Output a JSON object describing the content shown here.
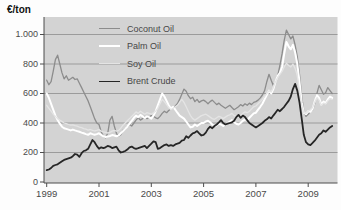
{
  "chart_data": {
    "type": "line",
    "title": "",
    "ylabel": "€/ton",
    "xlabel": "",
    "grid": true,
    "plot_bg": "#d3d3d3",
    "grid_color": "#9b9b9b",
    "axis_color": "#4d4d4d",
    "ylim": [
      0,
      1100
    ],
    "x_start_year": 1999,
    "x_months_per_point": 1,
    "legend_position": "top-left-overlay",
    "yticks": [
      {
        "value": 0,
        "label": "0"
      },
      {
        "value": 200,
        "label": "200"
      },
      {
        "value": 400,
        "label": "400"
      },
      {
        "value": 600,
        "label": "600"
      },
      {
        "value": 800,
        "label": "800"
      },
      {
        "value": 1000,
        "label": "1.000"
      }
    ],
    "xticks": [
      {
        "year": 1999,
        "label": "1999"
      },
      {
        "year": 2001,
        "label": "2001"
      },
      {
        "year": 2003,
        "label": "2003"
      },
      {
        "year": 2005,
        "label": "2005"
      },
      {
        "year": 2007,
        "label": "2007"
      },
      {
        "year": 2009,
        "label": "2009"
      }
    ],
    "series": [
      {
        "name": "Coconut Oil",
        "color": "#8c8c8c",
        "width": 1.3,
        "values": [
          690,
          660,
          680,
          750,
          830,
          860,
          800,
          740,
          700,
          720,
          690,
          700,
          710,
          695,
          700,
          670,
          640,
          610,
          580,
          550,
          510,
          470,
          430,
          400,
          390,
          340,
          310,
          300,
          330,
          420,
          445,
          380,
          330,
          310,
          320,
          350,
          360,
          375,
          390,
          380,
          400,
          420,
          435,
          420,
          430,
          445,
          430,
          440,
          450,
          445,
          435,
          430,
          445,
          465,
          480,
          470,
          485,
          495,
          505,
          515,
          530,
          560,
          595,
          630,
          615,
          585,
          565,
          575,
          545,
          560,
          540,
          550,
          555,
          545,
          530,
          545,
          555,
          540,
          525,
          535,
          520,
          510,
          500,
          510,
          520,
          505,
          490,
          500,
          510,
          525,
          515,
          530,
          520,
          535,
          525,
          540,
          545,
          555,
          570,
          590,
          620,
          680,
          730,
          690,
          655,
          680,
          720,
          790,
          870,
          960,
          1030,
          1000,
          970,
          990,
          930,
          850,
          730,
          580,
          480,
          445,
          460,
          475,
          490,
          530,
          600,
          655,
          625,
          595,
          605,
          640,
          620,
          600
        ]
      },
      {
        "name": "Palm Oil",
        "color": "#ffffff",
        "width": 2,
        "values": [
          600,
          570,
          530,
          490,
          450,
          420,
          395,
          375,
          365,
          360,
          355,
          350,
          355,
          350,
          345,
          340,
          335,
          330,
          325,
          320,
          330,
          325,
          320,
          325,
          330,
          320,
          310,
          305,
          308,
          312,
          318,
          315,
          310,
          315,
          330,
          345,
          360,
          375,
          395,
          415,
          435,
          450,
          440,
          455,
          445,
          435,
          445,
          440,
          430,
          450,
          480,
          520,
          560,
          600,
          580,
          550,
          520,
          500,
          510,
          490,
          470,
          450,
          440,
          430,
          410,
          390,
          370,
          375,
          390,
          380,
          390,
          400,
          400,
          410,
          415,
          405,
          390,
          380,
          385,
          395,
          390,
          380,
          390,
          400,
          410,
          420,
          405,
          395,
          390,
          400,
          415,
          425,
          420,
          435,
          450,
          465,
          470,
          490,
          510,
          530,
          560,
          590,
          620,
          600,
          630,
          680,
          720,
          740,
          780,
          870,
          950,
          920,
          900,
          930,
          880,
          800,
          680,
          540,
          470,
          460,
          480,
          475,
          495,
          545,
          590,
          570,
          525,
          545,
          535,
          560,
          580,
          570
        ]
      },
      {
        "name": "Soy Oil",
        "color": "#e4e4e4",
        "width": 1.3,
        "values": [
          520,
          500,
          480,
          460,
          445,
          430,
          420,
          410,
          400,
          395,
          390,
          385,
          388,
          382,
          378,
          372,
          368,
          362,
          358,
          352,
          356,
          350,
          346,
          350,
          355,
          345,
          340,
          336,
          332,
          336,
          345,
          350,
          345,
          350,
          365,
          385,
          400,
          415,
          430,
          445,
          460,
          475,
          465,
          480,
          470,
          460,
          470,
          465,
          460,
          470,
          480,
          500,
          530,
          560,
          545,
          525,
          505,
          490,
          500,
          510,
          520,
          540,
          560,
          540,
          510,
          480,
          450,
          430,
          420,
          430,
          440,
          450,
          455,
          460,
          450,
          440,
          430,
          425,
          435,
          445,
          440,
          430,
          440,
          450,
          455,
          465,
          450,
          445,
          440,
          450,
          465,
          475,
          470,
          480,
          495,
          510,
          515,
          530,
          545,
          560,
          580,
          600,
          620,
          610,
          640,
          680,
          710,
          730,
          750,
          780,
          805,
          790,
          780,
          800,
          770,
          720,
          620,
          520,
          470,
          465,
          480,
          490,
          505,
          540,
          570,
          555,
          520,
          535,
          530,
          550,
          565,
          560
        ]
      },
      {
        "name": "Brent Crude",
        "color": "#262626",
        "width": 1.8,
        "values": [
          80,
          85,
          95,
          110,
          115,
          120,
          130,
          140,
          150,
          155,
          160,
          165,
          175,
          190,
          185,
          170,
          195,
          210,
          215,
          225,
          255,
          285,
          270,
          245,
          225,
          235,
          230,
          235,
          245,
          240,
          230,
          235,
          240,
          215,
          200,
          205,
          210,
          220,
          235,
          240,
          230,
          225,
          230,
          235,
          240,
          245,
          230,
          245,
          260,
          275,
          270,
          225,
          230,
          240,
          250,
          255,
          245,
          250,
          245,
          255,
          260,
          265,
          280,
          285,
          310,
          300,
          315,
          330,
          335,
          345,
          330,
          315,
          320,
          335,
          360,
          375,
          365,
          380,
          390,
          405,
          420,
          400,
          390,
          395,
          400,
          405,
          415,
          440,
          455,
          435,
          450,
          440,
          420,
          400,
          390,
          380,
          370,
          380,
          390,
          400,
          415,
          425,
          440,
          430,
          450,
          470,
          490,
          480,
          495,
          510,
          530,
          550,
          580,
          630,
          665,
          620,
          540,
          430,
          320,
          270,
          255,
          250,
          265,
          280,
          300,
          320,
          330,
          350,
          340,
          355,
          370,
          380
        ]
      }
    ]
  }
}
